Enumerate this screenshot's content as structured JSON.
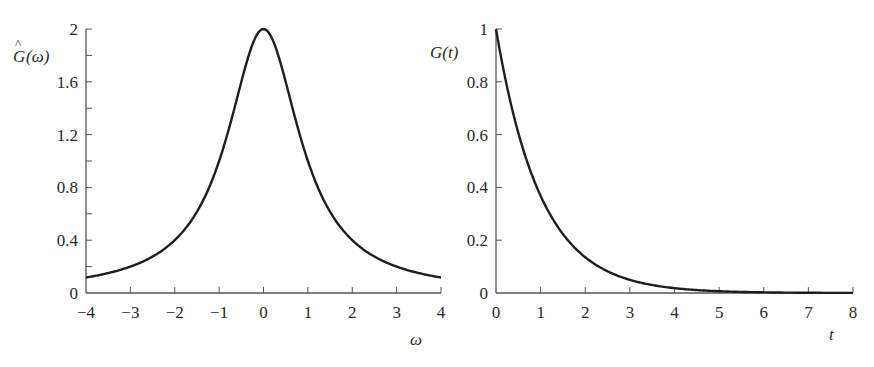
{
  "chart_data": [
    {
      "type": "line",
      "title": "",
      "ylabel": "Ĝ(ω)",
      "xlabel": "ω",
      "xlim": [
        -4,
        4
      ],
      "ylim": [
        0,
        2
      ],
      "x_ticks": [
        "−4",
        "−3",
        "−2",
        "−1",
        "0",
        "1",
        "2",
        "3",
        "4"
      ],
      "x_tick_values": [
        -4,
        -3,
        -2,
        -1,
        0,
        1,
        2,
        3,
        4
      ],
      "y_ticks": [
        "0",
        "0.4",
        "0.8",
        "1.2",
        "1.6",
        "2"
      ],
      "y_tick_values": [
        0,
        0.4,
        0.8,
        1.2,
        1.6,
        2
      ],
      "y_minor_ticks": [
        0.2,
        0.6,
        1.0,
        1.4,
        1.8
      ],
      "grid": false,
      "legend": null,
      "series": [
        {
          "name": "Ĝ(ω)",
          "x": [
            -4,
            -3.5,
            -3,
            -2.5,
            -2,
            -1.5,
            -1,
            -0.75,
            -0.5,
            -0.25,
            0,
            0.25,
            0.5,
            0.75,
            1,
            1.5,
            2,
            2.5,
            3,
            3.5,
            4
          ],
          "values": [
            0.12,
            0.15,
            0.2,
            0.28,
            0.4,
            0.62,
            1.0,
            1.28,
            1.6,
            1.88,
            2.0,
            1.88,
            1.6,
            1.28,
            1.0,
            0.62,
            0.4,
            0.28,
            0.2,
            0.15,
            0.12
          ]
        }
      ]
    },
    {
      "type": "line",
      "title": "",
      "ylabel": "G(t)",
      "xlabel": "t",
      "xlim": [
        0,
        8
      ],
      "ylim": [
        0,
        1
      ],
      "x_ticks": [
        "0",
        "1",
        "2",
        "3",
        "4",
        "5",
        "6",
        "7",
        "8"
      ],
      "x_tick_values": [
        0,
        1,
        2,
        3,
        4,
        5,
        6,
        7,
        8
      ],
      "y_ticks": [
        "0",
        "0.2",
        "0.4",
        "0.6",
        "0.8",
        "1"
      ],
      "y_tick_values": [
        0,
        0.2,
        0.4,
        0.6,
        0.8,
        1
      ],
      "grid": false,
      "legend": null,
      "series": [
        {
          "name": "G(t)",
          "x": [
            0,
            0.5,
            1,
            1.5,
            2,
            2.5,
            3,
            3.5,
            4,
            5,
            6,
            7,
            8
          ],
          "values": [
            1.0,
            0.61,
            0.37,
            0.22,
            0.14,
            0.08,
            0.05,
            0.03,
            0.02,
            0.007,
            0.002,
            0.001,
            0.0003
          ]
        }
      ]
    }
  ],
  "left": {
    "ylabel_base": "G",
    "ylabel_hat": "^",
    "ylabel_arg": "(ω)",
    "xlabel": "ω"
  },
  "right": {
    "ylabel": "G(t)",
    "xlabel": "t"
  }
}
